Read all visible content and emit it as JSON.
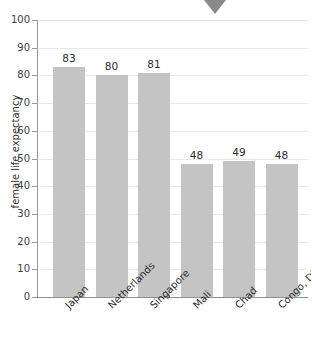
{
  "chart_data": {
    "type": "bar",
    "title": "",
    "xlabel": "",
    "ylabel": "female life expectancy",
    "categories": [
      "Japan",
      "Netherlands",
      "Singapore",
      "Mali",
      "Chad",
      "Congo, DR"
    ],
    "values": [
      83,
      80,
      81,
      48,
      49,
      48
    ],
    "ylim": [
      0,
      100
    ],
    "ytick_step": 10,
    "yticks": [
      "100",
      "90",
      "80",
      "70",
      "60",
      "50",
      "40",
      "30",
      "20",
      "10",
      "0"
    ],
    "grid": true,
    "legend": false,
    "bar_color": "#c4c4c4",
    "gridline_color": "#e9e9e9",
    "axis_color": "#8f8f8f",
    "data_labels": [
      "83",
      "80",
      "81",
      "48",
      "49",
      "48"
    ]
  },
  "annotations": {
    "marker_color": "#8a8a8a",
    "marker_name": "triangle-down-marker"
  },
  "title_strip": {
    "clipped_text": ""
  }
}
